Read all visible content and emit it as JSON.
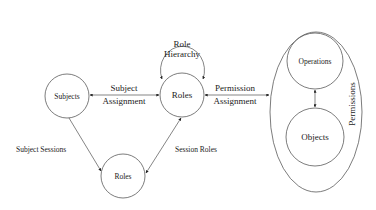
{
  "diagram": {
    "nodes": {
      "subjects": "Subjects",
      "roles_main": "Roles",
      "roles_session": "Roles",
      "role_hierarchy_line1": "Role",
      "role_hierarchy_line2": "Hierarchy",
      "operations": "Operations",
      "objects": "Objects",
      "permissions": "Permissions"
    },
    "edges": {
      "subject_assignment_line1": "Subject",
      "subject_assignment_line2": "Assignment",
      "permission_assignment_line1": "Permission",
      "permission_assignment_line2": "Assignment",
      "subject_sessions": "Subject Sessions",
      "session_roles": "Session Roles"
    }
  }
}
